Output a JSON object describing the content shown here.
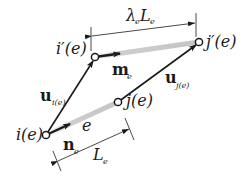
{
  "diagram": {
    "type": "element-displacement-schematic",
    "nodes": {
      "i": {
        "label": "i(e)"
      },
      "j": {
        "label": "j(e)"
      },
      "i_prime": {
        "label": "i′(e)"
      },
      "j_prime": {
        "label": "j′(e)"
      }
    },
    "element_label": "e",
    "vectors": {
      "u_i": {
        "base": "u",
        "sub": "i(e)"
      },
      "u_j": {
        "base": "u",
        "sub": "j(e)"
      },
      "n": {
        "base": "n",
        "sub": "e"
      },
      "m": {
        "base": "m",
        "sub": "e"
      }
    },
    "dimensions": {
      "original_length": {
        "base": "L",
        "sub": "e"
      },
      "deformed_length": {
        "lambda": "λ",
        "lambda_sub": "e",
        "base": "L",
        "sub": "e"
      }
    },
    "colors": {
      "ink": "#1a1a1a",
      "element_gray": "#c8c8c8"
    }
  }
}
